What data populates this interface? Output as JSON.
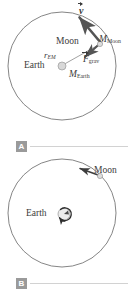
{
  "figure": {
    "type": "physics-diagram",
    "background_color": "#ffffff",
    "stroke_color": "#6e6e6e",
    "text_color": "#3b3b3b",
    "badge_color": "#9a9a9a",
    "rule_color": "#d2d2d2"
  },
  "panel_a": {
    "badge": "A",
    "orbit": {
      "center_x": 62,
      "center_y": 66,
      "radius": 54,
      "shape": "circle"
    },
    "bodies": [
      {
        "name": "Earth",
        "label": "Earth",
        "mass_label_main": "M",
        "mass_label_sub": "Earth",
        "x": 62,
        "y": 66,
        "radius": 4,
        "fill": "#d8d8d8"
      },
      {
        "name": "Moon",
        "label": "Moon",
        "mass_label_main": "M",
        "mass_label_sub": "Moon",
        "x": 100,
        "y": 44,
        "radius": 2.6,
        "fill": "#d8d8d8"
      }
    ],
    "radius_label_main": "r",
    "radius_label_sub": "EM",
    "vectors": [
      {
        "name": "velocity",
        "symbol": "v",
        "style": "bold-italic-with-overarrow",
        "from_x": 100,
        "from_y": 44,
        "to_x": 78,
        "to_y": 16,
        "description": "tangential velocity of Moon, points up-left"
      },
      {
        "name": "gravitational-force",
        "symbol_main": "F",
        "symbol_sub": "grav",
        "style": "italic-with-overarrow",
        "from_x": 100,
        "from_y": 44,
        "to_x": 84,
        "to_y": 58,
        "description": "gravitational force on Moon, points toward Earth"
      }
    ]
  },
  "panel_b": {
    "badge": "B",
    "orbit": {
      "center_x": 62,
      "center_y": 213,
      "radius": 54,
      "shape": "circle"
    },
    "bodies": [
      {
        "name": "Earth",
        "label": "Earth",
        "x": 64,
        "y": 214,
        "radius": 6,
        "fill": "#e0e0e0",
        "rotation_arrow": "counterclockwise"
      },
      {
        "name": "Moon",
        "label": "Moon",
        "x": 100,
        "y": 176,
        "radius": 2.6,
        "fill": "#d8d8d8"
      }
    ],
    "vectors": [
      {
        "name": "moon-motion",
        "from_x": 100,
        "from_y": 176,
        "to_x": 78,
        "to_y": 168,
        "description": "direction of Moon orbital motion, points up-left"
      }
    ]
  }
}
